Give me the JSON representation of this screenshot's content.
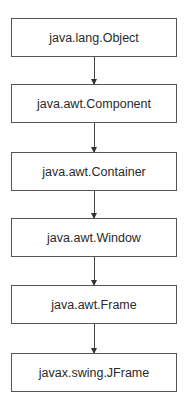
{
  "diagram": {
    "type": "class-hierarchy",
    "nodes": [
      {
        "id": "n1",
        "label": "java.lang.Object"
      },
      {
        "id": "n2",
        "label": "java.awt.Component"
      },
      {
        "id": "n3",
        "label": "java.awt.Container"
      },
      {
        "id": "n4",
        "label": "java.awt.Window"
      },
      {
        "id": "n5",
        "label": "java.awt.Frame"
      },
      {
        "id": "n6",
        "label": "javax.swing.JFrame"
      }
    ],
    "edges": [
      {
        "from": "n1",
        "to": "n2"
      },
      {
        "from": "n2",
        "to": "n3"
      },
      {
        "from": "n3",
        "to": "n4"
      },
      {
        "from": "n4",
        "to": "n5"
      },
      {
        "from": "n5",
        "to": "n6"
      }
    ]
  }
}
